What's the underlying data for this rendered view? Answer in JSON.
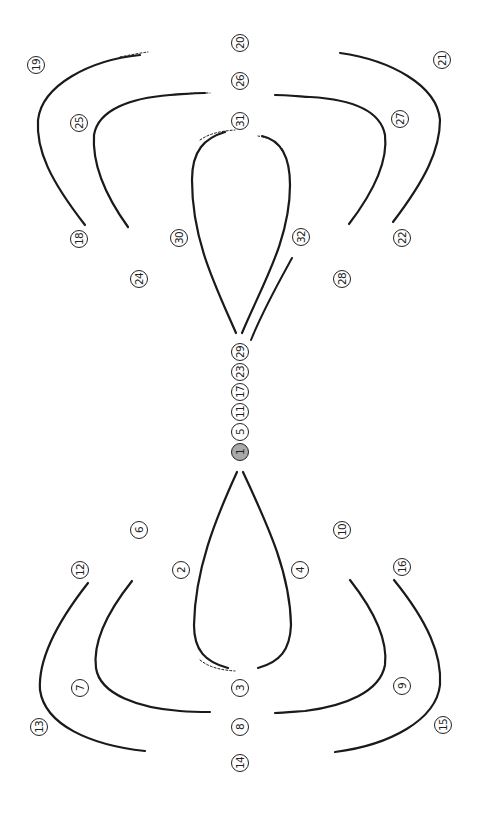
{
  "diagram": {
    "start_label": "1",
    "stroke_color": "#1a1a1a",
    "start_fill": "#a9a9a9",
    "labels": [
      {
        "id": "1",
        "x": 240,
        "y": 452,
        "start": true
      },
      {
        "id": "5",
        "x": 240,
        "y": 432
      },
      {
        "id": "11",
        "x": 240,
        "y": 412
      },
      {
        "id": "17",
        "x": 240,
        "y": 392
      },
      {
        "id": "23",
        "x": 240,
        "y": 372
      },
      {
        "id": "29",
        "x": 240,
        "y": 352
      },
      {
        "id": "2",
        "x": 181,
        "y": 570
      },
      {
        "id": "3",
        "x": 240,
        "y": 688
      },
      {
        "id": "4",
        "x": 300,
        "y": 570
      },
      {
        "id": "6",
        "x": 139,
        "y": 530
      },
      {
        "id": "7",
        "x": 80,
        "y": 688
      },
      {
        "id": "8",
        "x": 240,
        "y": 727
      },
      {
        "id": "9",
        "x": 402,
        "y": 686
      },
      {
        "id": "10",
        "x": 342,
        "y": 530
      },
      {
        "id": "12",
        "x": 80,
        "y": 570
      },
      {
        "id": "13",
        "x": 39,
        "y": 727
      },
      {
        "id": "14",
        "x": 240,
        "y": 763
      },
      {
        "id": "15",
        "x": 443,
        "y": 725
      },
      {
        "id": "16",
        "x": 402,
        "y": 567
      },
      {
        "id": "18",
        "x": 79,
        "y": 239
      },
      {
        "id": "19",
        "x": 36,
        "y": 65
      },
      {
        "id": "20",
        "x": 240,
        "y": 43
      },
      {
        "id": "21",
        "x": 442,
        "y": 60
      },
      {
        "id": "22",
        "x": 402,
        "y": 238
      },
      {
        "id": "24",
        "x": 139,
        "y": 279
      },
      {
        "id": "25",
        "x": 79,
        "y": 123
      },
      {
        "id": "26",
        "x": 240,
        "y": 81
      },
      {
        "id": "27",
        "x": 400,
        "y": 119
      },
      {
        "id": "28",
        "x": 342,
        "y": 279
      },
      {
        "id": "30",
        "x": 179,
        "y": 238
      },
      {
        "id": "31",
        "x": 240,
        "y": 121
      },
      {
        "id": "32",
        "x": 301,
        "y": 237
      }
    ]
  }
}
